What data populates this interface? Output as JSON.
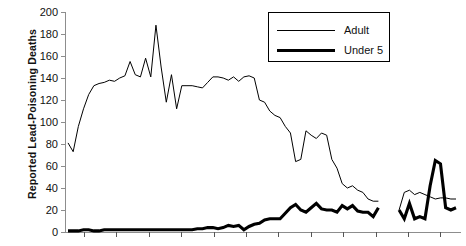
{
  "chart_data": {
    "type": "line",
    "title": "",
    "xlabel": "",
    "ylabel": "Reported Lead-Poisoning Deaths",
    "ylim": [
      0,
      200
    ],
    "yticks": [
      0,
      20,
      40,
      60,
      80,
      100,
      120,
      140,
      160,
      180,
      200
    ],
    "ytick_labels": [
      "0",
      "20",
      "40",
      "60",
      "80",
      "100",
      "120",
      "140",
      "160",
      "180",
      "200"
    ],
    "xtick_count": 13,
    "xtick_labels": [],
    "grid": false,
    "legend_position": "top-right",
    "legend": [
      "Adult",
      "Under 5"
    ],
    "series": [
      {
        "name": "Adult",
        "style": "thin",
        "color": "#000000",
        "x": [
          0,
          1,
          2,
          3,
          4,
          5,
          6,
          7,
          8,
          9,
          10,
          11,
          12,
          13,
          14,
          15,
          16,
          17,
          18,
          19,
          20,
          21,
          22,
          23,
          24,
          25,
          26,
          27,
          28,
          29,
          30,
          31,
          32,
          33,
          34,
          35,
          36,
          37,
          38,
          39,
          40,
          41,
          42,
          43,
          44,
          45,
          46,
          47,
          48,
          49,
          50,
          51,
          52,
          53,
          54,
          55,
          56,
          57,
          58,
          59,
          60,
          61,
          62,
          63,
          64,
          65,
          66,
          67,
          68,
          69,
          70,
          71,
          72,
          73,
          74,
          75
        ],
        "values": [
          81,
          73,
          96,
          112,
          125,
          133,
          135,
          136,
          138,
          137,
          140,
          142,
          155,
          143,
          141,
          158,
          141,
          188,
          150,
          118,
          143,
          112,
          133,
          133,
          133,
          132,
          131,
          136,
          141,
          141,
          140,
          138,
          141,
          137,
          141,
          142,
          140,
          120,
          118,
          110,
          106,
          104,
          96,
          90,
          64,
          66,
          92,
          88,
          85,
          90,
          88,
          66,
          58,
          44,
          40,
          42,
          38,
          36,
          30,
          28,
          28,
          null,
          null,
          null,
          20,
          36,
          38,
          34,
          36,
          34,
          32,
          30,
          31,
          31,
          30,
          30
        ]
      },
      {
        "name": "Under 5",
        "style": "thick",
        "color": "#000000",
        "x": [
          0,
          1,
          2,
          3,
          4,
          5,
          6,
          7,
          8,
          9,
          10,
          11,
          12,
          13,
          14,
          15,
          16,
          17,
          18,
          19,
          20,
          21,
          22,
          23,
          24,
          25,
          26,
          27,
          28,
          29,
          30,
          31,
          32,
          33,
          34,
          35,
          36,
          37,
          38,
          39,
          40,
          41,
          42,
          43,
          44,
          45,
          46,
          47,
          48,
          49,
          50,
          51,
          52,
          53,
          54,
          55,
          56,
          57,
          58,
          59,
          60,
          61,
          62,
          63,
          64,
          65,
          66,
          67,
          68,
          69,
          70,
          71,
          72,
          73,
          74,
          75
        ],
        "values": [
          1,
          1,
          1,
          2,
          2,
          1,
          1,
          2,
          2,
          2,
          2,
          2,
          2,
          2,
          2,
          2,
          2,
          2,
          2,
          2,
          2,
          2,
          2,
          2,
          2,
          3,
          3,
          4,
          4,
          3,
          4,
          6,
          5,
          6,
          2,
          5,
          7,
          8,
          11,
          12,
          12,
          12,
          17,
          22,
          25,
          20,
          18,
          22,
          26,
          21,
          20,
          20,
          18,
          24,
          21,
          24,
          19,
          18,
          18,
          14,
          22,
          null,
          null,
          null,
          20,
          12,
          26,
          12,
          14,
          12,
          42,
          65,
          62,
          22,
          20,
          22
        ]
      }
    ]
  },
  "axis": {
    "y_title": "Reported Lead-Poisoning Deaths"
  }
}
